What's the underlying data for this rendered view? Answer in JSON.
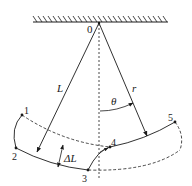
{
  "diagram": {
    "title": "",
    "pivot": {
      "label": "0",
      "x": 99,
      "y": 23
    },
    "ceiling": {
      "x1": 33,
      "x2": 168,
      "y": 22
    },
    "rods": [
      {
        "id": "L",
        "label": "L",
        "from": [
          99,
          23
        ],
        "to": [
          37,
          152
        ]
      },
      {
        "id": "r",
        "label": "r",
        "from": [
          99,
          23
        ],
        "to": [
          147,
          136
        ]
      }
    ],
    "angle": {
      "label": "θ"
    },
    "delta": {
      "label": "ΔL"
    },
    "points": [
      {
        "id": "1",
        "label": "1",
        "x": 22,
        "y": 115
      },
      {
        "id": "2",
        "label": "2",
        "x": 16,
        "y": 148
      },
      {
        "id": "3",
        "label": "3",
        "x": 88,
        "y": 170
      },
      {
        "id": "4",
        "label": "4",
        "x": 110,
        "y": 147
      },
      {
        "id": "5",
        "label": "5",
        "x": 175,
        "y": 122
      }
    ],
    "colors": {
      "stroke": "#1a1a1a",
      "background": "#ffffff"
    }
  }
}
